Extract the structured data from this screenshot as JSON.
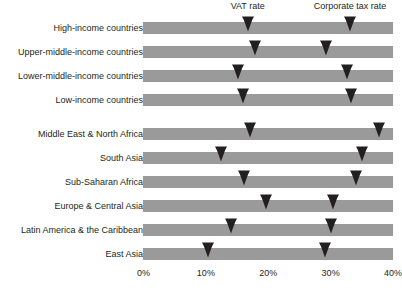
{
  "chart_data": {
    "type": "bar",
    "title": "",
    "subtitle": "",
    "xlabel": "",
    "ylabel": "",
    "xlim": [
      0,
      40
    ],
    "xticks": [
      0,
      10,
      20,
      30,
      40
    ],
    "xtick_labels": [
      "0%",
      "10%",
      "20%",
      "30%",
      "40%"
    ],
    "grid": false,
    "legend_position": "top",
    "series": [
      {
        "name": "VAT rate",
        "marker": "down-arrow",
        "color": "#231f20"
      },
      {
        "name": "Corporate tax rate",
        "marker": "down-arrow",
        "color": "#231f20"
      }
    ],
    "categories": [
      "High-income countries",
      "Upper-middle-income countries",
      "Lower-middle-income countries",
      "Low-income countries",
      "Middle East & North Africa",
      "South Asia",
      "Sub-Saharan Africa",
      "Europe & Central Asia",
      "Latin America & the Caribbean",
      "East Asia"
    ],
    "rows": [
      {
        "label": "High-income countries",
        "vat_rate": 16.7,
        "corporate_tax_rate": 33.1,
        "gap_after": false
      },
      {
        "label": "Upper-middle-income countries",
        "vat_rate": 17.8,
        "corporate_tax_rate": 29.2,
        "gap_after": false
      },
      {
        "label": "Lower-middle-income countries",
        "vat_rate": 15.1,
        "corporate_tax_rate": 32.6,
        "gap_after": false
      },
      {
        "label": "Low-income countries",
        "vat_rate": 15.9,
        "corporate_tax_rate": 33.3,
        "gap_after": true
      },
      {
        "label": "Middle East & North Africa",
        "vat_rate": 17.0,
        "corporate_tax_rate": 37.8,
        "gap_after": false
      },
      {
        "label": "South Asia",
        "vat_rate": 12.5,
        "corporate_tax_rate": 35.0,
        "gap_after": false
      },
      {
        "label": "Sub-Saharan Africa",
        "vat_rate": 16.1,
        "corporate_tax_rate": 34.1,
        "gap_after": false
      },
      {
        "label": "Europe & Central Asia",
        "vat_rate": 19.6,
        "corporate_tax_rate": 30.4,
        "gap_after": false
      },
      {
        "label": "Latin America & the Caribbean",
        "vat_rate": 14.0,
        "corporate_tax_rate": 30.0,
        "gap_after": false
      },
      {
        "label": "East Asia",
        "vat_rate": 10.4,
        "corporate_tax_rate": 29.1,
        "gap_after": false
      }
    ],
    "bar_color": "#9a9a9a",
    "marker_color": "#231f20",
    "background": "#ffffff"
  },
  "annotations": {
    "vat_label": "VAT rate",
    "corporate_label": "Corporate tax rate",
    "vat_anchor_value": 16.7,
    "corporate_anchor_value": 33.1
  }
}
